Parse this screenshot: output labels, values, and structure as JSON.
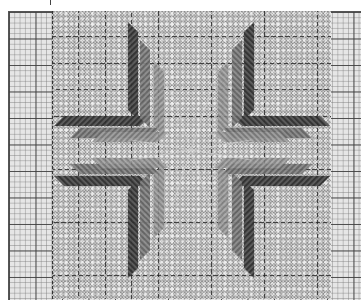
{
  "chart": {
    "kind": "needlepoint stitch chart",
    "motif": "eight-pointed star",
    "colors": {
      "paper": "#ffffff",
      "grid_background": "#e6e6e6",
      "grid_line_fine": "#9a9a9a",
      "grid_line_bold": "#3c3c3c",
      "pattern_background": "#a9a9a9",
      "star_dark": "#3a3a3a",
      "star_mid": "#6e6e6e",
      "star_light": "#8c8c8c"
    },
    "grid": {
      "fine_cell_px": 5.3,
      "bold_every_cells": 5,
      "left_border_columns": 8,
      "right_border_columns": 6
    }
  }
}
